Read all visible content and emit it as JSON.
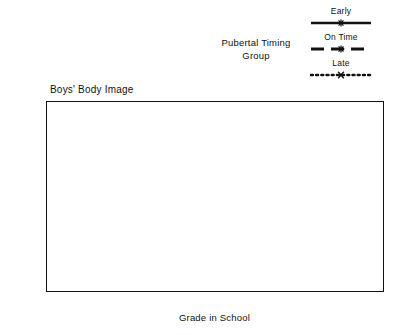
{
  "figure": {
    "plot_title": "Boys' Body Image",
    "legend_title": "Pubertal Timing\nGroup"
  },
  "legend": {
    "entries": [
      {
        "label": "Early",
        "style": "solid",
        "marker": "star"
      },
      {
        "label": "On Time",
        "style": "dashed",
        "marker": "star"
      },
      {
        "label": "Late",
        "style": "dotted",
        "marker": "x"
      }
    ]
  },
  "chart_data": {
    "type": "line",
    "title": "Boys' Body Image",
    "xlabel": "Grade in School",
    "ylabel": "",
    "legend_title": "Pubertal Timing Group",
    "legend_position": "top-right",
    "grid": false,
    "x": [
      6,
      7,
      8,
      12
    ],
    "categories": [
      "6th",
      "7th",
      "8th",
      "12th"
    ],
    "x_tick_positions": [
      6,
      7,
      8,
      9,
      10,
      11,
      12
    ],
    "x_tick_labels": [
      "6th",
      "7th",
      "8th",
      "",
      "",
      "",
      "12th"
    ],
    "xlim": [
      5.65,
      12.35
    ],
    "ylim": [
      4.0,
      5.2
    ],
    "y_ticks": [
      4.0,
      4.2,
      4.4,
      4.6,
      4.8,
      5.0,
      5.2
    ],
    "y_tick_labels": [
      "4.0",
      "4.2",
      "4.4",
      "4.6",
      "4.8",
      "5.0",
      "5.2"
    ],
    "series": [
      {
        "name": "Early",
        "style": "solid",
        "marker": "star",
        "values": [
          4.48,
          4.57,
          4.46,
          4.95
        ]
      },
      {
        "name": "On Time",
        "style": "dashed",
        "marker": "star",
        "values": [
          4.97,
          4.63,
          4.46,
          5.03
        ]
      },
      {
        "name": "Late",
        "style": "dotted",
        "marker": "x",
        "values": [
          4.9,
          4.14,
          4.63,
          5.11
        ]
      }
    ]
  }
}
